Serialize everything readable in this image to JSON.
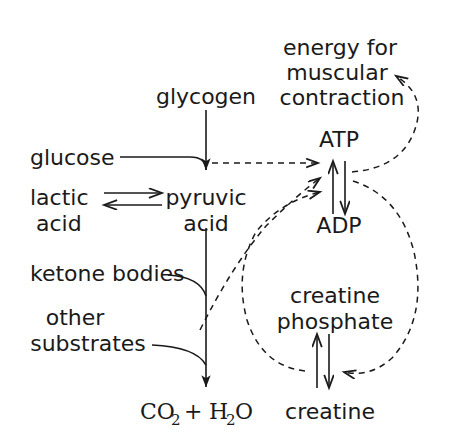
{
  "diagram": {
    "background_color": "#ffffff",
    "stroke_color": "#1a1a1a",
    "nodes": {
      "energy_line1": "energy for",
      "energy_line2": "muscular",
      "energy_line3": "contraction",
      "glycogen": "glycogen",
      "atp": "ATP",
      "glucose": "glucose",
      "lactic_line1": "lactic",
      "lactic_line2": "acid",
      "pyruvic_line1": "pyruvic",
      "pyruvic_line2": "acid",
      "adp": "ADP",
      "ketone_bodies": "ketone bodies",
      "other_line1": "other",
      "other_line2": "substrates",
      "creatine_phosphate_line1": "creatine",
      "creatine_phosphate_line2": "phosphate",
      "co2": "CO",
      "co2_sub": "2",
      "plus": "+",
      "h2o_h": "H",
      "h2o_sub": "2",
      "h2o_o": "O",
      "creatine": "creatine"
    },
    "connections": [
      {
        "name": "glycogen-to-pyruvic",
        "style": "solid",
        "from": "glycogen",
        "to": "pyruvic acid"
      },
      {
        "name": "glucose-to-pyruvic",
        "style": "solid",
        "from": "glucose",
        "to": "pyruvic acid"
      },
      {
        "name": "lactic-pyruvic-equilibrium",
        "style": "solid",
        "from": "lactic acid",
        "to": "pyruvic acid"
      },
      {
        "name": "pyruvic-to-co2",
        "style": "solid",
        "from": "pyruvic acid",
        "to": "CO2 + H2O"
      },
      {
        "name": "ketone-bodies-to-co2",
        "style": "solid",
        "from": "ketone bodies",
        "to": "CO2 + H2O"
      },
      {
        "name": "other-substrates-to-co2",
        "style": "solid",
        "from": "other substrates",
        "to": "CO2 + H2O"
      },
      {
        "name": "atp-adp-equilibrium",
        "style": "solid",
        "from": "ATP",
        "to": "ADP"
      },
      {
        "name": "creatine-phosphate-creatine-equilibrium",
        "style": "solid",
        "from": "creatine phosphate",
        "to": "creatine"
      },
      {
        "name": "glycolysis-to-atp",
        "style": "dashed",
        "from": "pyruvic acid",
        "to": "ATP"
      },
      {
        "name": "oxidation-to-atp",
        "style": "dashed",
        "from": "CO2 + H2O pathway",
        "to": "ATP"
      },
      {
        "name": "creatine-phosphate-to-atp",
        "style": "dashed",
        "from": "creatine phosphate",
        "to": "ATP"
      },
      {
        "name": "atp-to-muscular-contraction",
        "style": "dashed",
        "from": "ATP",
        "to": "energy for muscular contraction"
      },
      {
        "name": "adp-to-creatine",
        "style": "dashed",
        "from": "ADP",
        "to": "creatine"
      }
    ]
  }
}
